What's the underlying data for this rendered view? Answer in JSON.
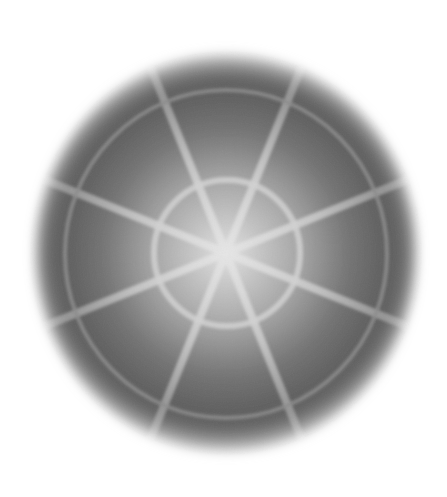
{
  "image": {
    "width": 447,
    "height": 497,
    "background": "#ffffff",
    "subject": "blurred grayscale radial disk with spokes and concentric rings"
  },
  "disk": {
    "center": [
      226,
      253
    ],
    "radius": 200,
    "edge_color": "#ffffff",
    "dark_color": "#5c5c5c",
    "mid_color": "#a8a8a8",
    "center_color": "#e0e0e0"
  },
  "rings": [
    {
      "name": "inner-ring",
      "radius": 73,
      "stroke": "#d4d4d4",
      "width": 6
    },
    {
      "name": "outer-ring",
      "radius": 162,
      "stroke": "#8a8a8a",
      "width": 4
    }
  ],
  "spokes": {
    "count": 8,
    "angles_deg": [
      -68,
      -112,
      -158,
      158,
      112,
      68,
      22,
      -22
    ],
    "stroke": "#d0d0d0",
    "width": 8,
    "length": 200
  }
}
